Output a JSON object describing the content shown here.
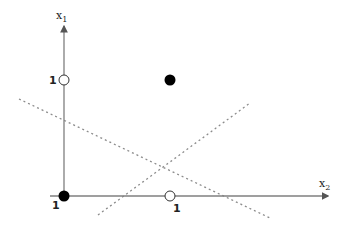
{
  "diagram": {
    "type": "xor-decision-boundaries",
    "axes": {
      "vertical_label": "x",
      "vertical_subscript": "1",
      "horizontal_label": "x",
      "horizontal_subscript": "2",
      "axis_color": "#7f7f7f"
    },
    "tick_labels": {
      "vertical_one": "1",
      "horizontal_one": "1",
      "origin": "1"
    },
    "points": [
      {
        "name": "origin-point",
        "x1": 0,
        "x2": 0,
        "fill": "filled",
        "color": "#000000"
      },
      {
        "name": "top-left-point",
        "x1": 1,
        "x2": 0,
        "fill": "open",
        "color": "#ffffff"
      },
      {
        "name": "bottom-right-point",
        "x1": 0,
        "x2": 1,
        "fill": "open",
        "color": "#ffffff"
      },
      {
        "name": "top-right-point",
        "x1": 1,
        "x2": 1,
        "fill": "filled",
        "color": "#000000"
      }
    ],
    "decision_lines": [
      {
        "name": "decision-line-descending",
        "style": "dotted",
        "color": "#8c8c8c"
      },
      {
        "name": "decision-line-ascending",
        "style": "dotted",
        "color": "#8c8c8c"
      }
    ]
  }
}
